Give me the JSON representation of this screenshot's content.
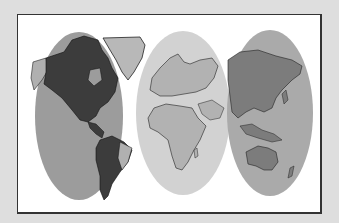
{
  "figure": {
    "colors": {
      "background": "#dedede",
      "panel": "#ffffff",
      "border": "#333333",
      "zone_americas_fill": "#9c9c9c",
      "zone_americas_land": "#3c3c3c",
      "zone_europe_africa_fill": "#d2d2d2",
      "zone_europe_africa_land": "#b2b2b2",
      "zone_asia_oceania_fill": "#aaaaaa",
      "zone_asia_oceania_land": "#7c7c7c",
      "greenland_land": "#b8b8b8"
    },
    "zones": [
      {
        "name": "Americas",
        "shade": "dark"
      },
      {
        "name": "Europe and Africa",
        "shade": "light"
      },
      {
        "name": "Asia and Oceania",
        "shade": "medium"
      }
    ]
  }
}
